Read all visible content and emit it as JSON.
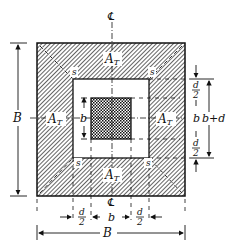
{
  "diagram": {
    "type": "footing-plan",
    "colors": {
      "ink": "#111111",
      "background": "#ffffff"
    },
    "labels": {
      "centerline_top": "℄",
      "centerline_bottom": "℄",
      "tributary_top": "A",
      "tributary_top_sub": "T",
      "tributary_left": "A",
      "tributary_left_sub": "T",
      "tributary_right": "A",
      "tributary_right_sub": "T",
      "tributary_bottom": "A",
      "tributary_bottom_sub": "T",
      "corner_tl": "s",
      "corner_tr": "s",
      "corner_bl": "s",
      "corner_br": "s",
      "column_width": "b",
      "footing_width_left": "B",
      "footing_width_bottom": "B",
      "right_d_top_num": "d",
      "right_d_top_den": "2",
      "right_b": "b",
      "right_d_bot_num": "d",
      "right_d_bot_den": "2",
      "right_total": "b+d",
      "bottom_d_left_num": "d",
      "bottom_d_left_den": "2",
      "bottom_b": "b",
      "bottom_d_right_num": "d",
      "bottom_d_right_den": "2"
    }
  }
}
